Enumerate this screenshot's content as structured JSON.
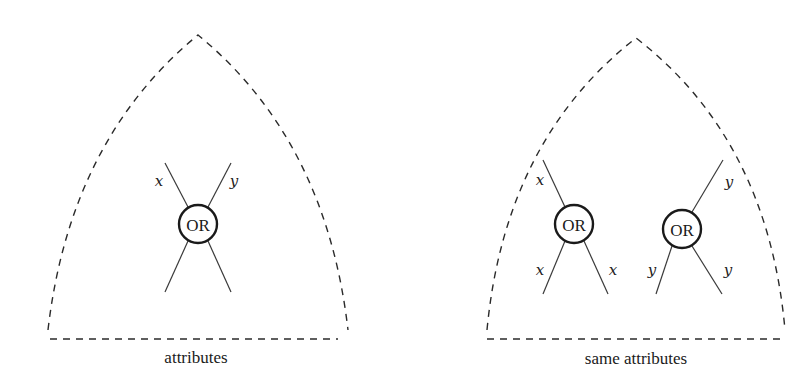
{
  "figure": {
    "left_panel": {
      "caption": "attributes",
      "node": {
        "label": "OR",
        "cx": 198,
        "cy": 224,
        "r": 19
      },
      "edge_labels": {
        "top_left": "x",
        "top_right": "y"
      }
    },
    "right_panel": {
      "caption": "same attributes",
      "nodes": [
        {
          "label": "OR",
          "cx": 574,
          "cy": 224,
          "r": 19,
          "edge_labels": {
            "top_left": "x",
            "bottom_left": "x",
            "bottom_right": "x"
          }
        },
        {
          "label": "OR",
          "cx": 682,
          "cy": 229,
          "r": 19,
          "edge_labels": {
            "top_right": "y",
            "bottom_left": "y",
            "bottom_right": "y"
          }
        }
      ]
    }
  },
  "colors": {
    "stroke": "#1a1a1a",
    "background": "#ffffff"
  }
}
